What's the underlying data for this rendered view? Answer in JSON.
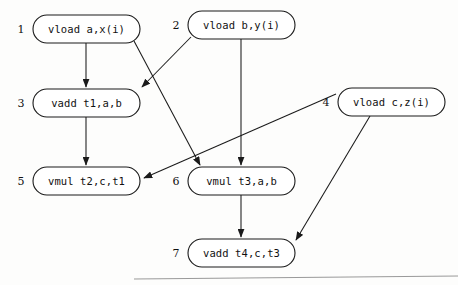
{
  "figure": {
    "kind": "dependence-graph",
    "background_color": "#fdfdfc",
    "line_color": "#1a1a1a",
    "text_color": "#111111"
  },
  "nodes": [
    {
      "id": "n1",
      "index": "1",
      "label": "vload a,x(i)",
      "x": 33,
      "y": 15,
      "w": 107,
      "h": 28
    },
    {
      "id": "n2",
      "index": "2",
      "label": "vload b,y(i)",
      "x": 188,
      "y": 11,
      "w": 107,
      "h": 28
    },
    {
      "id": "n3",
      "index": "3",
      "label": "vadd t1,a,b",
      "x": 33,
      "y": 89,
      "w": 107,
      "h": 28
    },
    {
      "id": "n4",
      "index": "4",
      "label": "vload c,z(i)",
      "x": 338,
      "y": 88,
      "w": 107,
      "h": 28
    },
    {
      "id": "n5",
      "index": "5",
      "label": "vmul t2,c,t1",
      "x": 33,
      "y": 167,
      "w": 107,
      "h": 28
    },
    {
      "id": "n6",
      "index": "6",
      "label": "vmul t3,a,b",
      "x": 188,
      "y": 167,
      "w": 107,
      "h": 28
    },
    {
      "id": "n7",
      "index": "7",
      "label": "vadd t4,c,t3",
      "x": 188,
      "y": 239,
      "w": 107,
      "h": 28
    }
  ],
  "edges": [
    {
      "id": "e1",
      "from": "1",
      "to": "3",
      "x1": 86,
      "y1": 43,
      "x2": 86,
      "y2": 87
    },
    {
      "id": "e2",
      "from": "1",
      "to": "6",
      "x1": 134,
      "y1": 41,
      "x2": 200,
      "y2": 165
    },
    {
      "id": "e3",
      "from": "2",
      "to": "3",
      "x1": 191,
      "y1": 37,
      "x2": 142,
      "y2": 87
    },
    {
      "id": "e4",
      "from": "2",
      "to": "6",
      "x1": 241,
      "y1": 39,
      "x2": 241,
      "y2": 165
    },
    {
      "id": "e5",
      "from": "3",
      "to": "5",
      "x1": 86,
      "y1": 117,
      "x2": 86,
      "y2": 165
    },
    {
      "id": "e6",
      "from": "4",
      "to": "5",
      "x1": 336,
      "y1": 94,
      "x2": 144,
      "y2": 178
    },
    {
      "id": "e7",
      "from": "4",
      "to": "7",
      "x1": 370,
      "y1": 116,
      "x2": 296,
      "y2": 240
    },
    {
      "id": "e8",
      "from": "6",
      "to": "7",
      "x1": 241,
      "y1": 195,
      "x2": 241,
      "y2": 237
    }
  ],
  "page_rule": {
    "x1": 134,
    "y1": 279,
    "x2": 458,
    "y2": 276
  }
}
